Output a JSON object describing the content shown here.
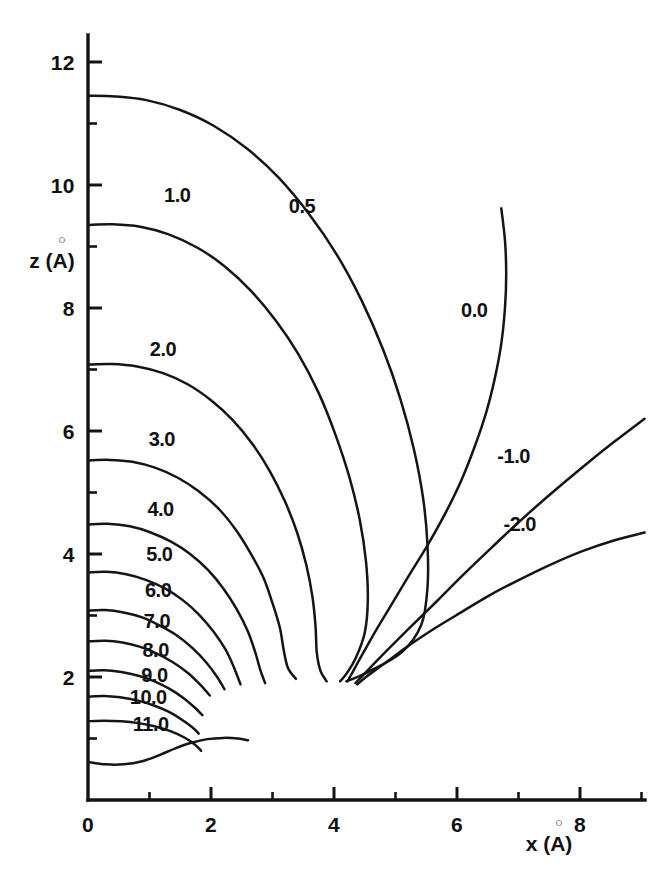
{
  "figure": {
    "kind": "contour-plot",
    "background_color": "#ffffff",
    "line_color": "#151515",
    "width": 652,
    "height": 873
  },
  "axes": {
    "x": {
      "title": "x (A)",
      "title_symbol": "x",
      "title_unit": "(Å)",
      "unit_letter": "A",
      "min": 0,
      "max": 9.15,
      "major_ticks": [
        0,
        2,
        4,
        6,
        8
      ],
      "major_tick_labels": [
        "0",
        "2",
        "4",
        "6",
        "8"
      ],
      "minor_ticks": [
        1,
        3,
        5,
        7,
        9
      ]
    },
    "z": {
      "title": "z (A)",
      "title_symbol": "z",
      "title_unit": "(Å)",
      "unit_letter": "A",
      "min": 0,
      "max": 12.45,
      "major_ticks": [
        2,
        4,
        6,
        8,
        10,
        12
      ],
      "major_tick_labels": [
        "2",
        "4",
        "6",
        "8",
        "10",
        "12"
      ],
      "minor_ticks": [
        1,
        3,
        5,
        7,
        9,
        11
      ]
    }
  },
  "chart_data": {
    "type": "line",
    "subtype": "contour",
    "title": "",
    "xlabel": "x (Å)",
    "ylabel": "z (Å)",
    "xlim": [
      0,
      9.15
    ],
    "ylim": [
      0,
      12.45
    ],
    "grid": false,
    "legend": "none",
    "label_format": "inline contour labels",
    "contour_levels": [
      0.5,
      1.0,
      2.0,
      3.0,
      4.0,
      5.0,
      6.0,
      7.0,
      8.0,
      9.0,
      10.0,
      11.0,
      0.0,
      -1.0,
      -2.0
    ],
    "convergence_point": {
      "x": 4.0,
      "z": 2.0
    },
    "series": [
      {
        "name": "0.5",
        "label": "0.5",
        "label_at": {
          "x": 3.48,
          "z": 9.55
        },
        "z_intercept": 11.45,
        "points": [
          {
            "x": 0.0,
            "z": 11.45
          },
          {
            "x": 0.45,
            "z": 11.44
          },
          {
            "x": 0.95,
            "z": 11.38
          },
          {
            "x": 1.5,
            "z": 11.22
          },
          {
            "x": 2.05,
            "z": 10.96
          },
          {
            "x": 2.6,
            "z": 10.58
          },
          {
            "x": 3.1,
            "z": 10.12
          },
          {
            "x": 3.6,
            "z": 9.52
          },
          {
            "x": 4.05,
            "z": 8.86
          },
          {
            "x": 4.45,
            "z": 8.12
          },
          {
            "x": 4.8,
            "z": 7.32
          },
          {
            "x": 5.08,
            "z": 6.52
          },
          {
            "x": 5.3,
            "z": 5.7
          },
          {
            "x": 5.45,
            "z": 4.9
          },
          {
            "x": 5.52,
            "z": 4.15
          },
          {
            "x": 5.52,
            "z": 3.45
          },
          {
            "x": 5.42,
            "z": 2.85
          },
          {
            "x": 5.1,
            "z": 2.4
          },
          {
            "x": 4.55,
            "z": 2.08
          },
          {
            "x": 4.2,
            "z": 1.93
          }
        ]
      },
      {
        "name": "1.0",
        "label": "1.0",
        "label_at": {
          "x": 1.45,
          "z": 9.72
        },
        "z_intercept": 9.35,
        "points": [
          {
            "x": 0.0,
            "z": 9.35
          },
          {
            "x": 0.4,
            "z": 9.36
          },
          {
            "x": 0.85,
            "z": 9.32
          },
          {
            "x": 1.3,
            "z": 9.2
          },
          {
            "x": 1.78,
            "z": 8.98
          },
          {
            "x": 2.22,
            "z": 8.68
          },
          {
            "x": 2.65,
            "z": 8.28
          },
          {
            "x": 3.05,
            "z": 7.8
          },
          {
            "x": 3.42,
            "z": 7.25
          },
          {
            "x": 3.75,
            "z": 6.62
          },
          {
            "x": 4.02,
            "z": 5.95
          },
          {
            "x": 4.25,
            "z": 5.25
          },
          {
            "x": 4.42,
            "z": 4.55
          },
          {
            "x": 4.52,
            "z": 3.88
          },
          {
            "x": 4.55,
            "z": 3.25
          },
          {
            "x": 4.5,
            "z": 2.72
          },
          {
            "x": 4.35,
            "z": 2.3
          },
          {
            "x": 4.2,
            "z": 2.05
          },
          {
            "x": 4.1,
            "z": 1.93
          }
        ]
      },
      {
        "name": "2.0",
        "label": "2.0",
        "label_at": {
          "x": 1.22,
          "z": 7.22
        },
        "z_intercept": 7.08,
        "points": [
          {
            "x": 0.0,
            "z": 7.08
          },
          {
            "x": 0.38,
            "z": 7.09
          },
          {
            "x": 0.8,
            "z": 7.05
          },
          {
            "x": 1.22,
            "z": 6.94
          },
          {
            "x": 1.62,
            "z": 6.76
          },
          {
            "x": 2.0,
            "z": 6.5
          },
          {
            "x": 2.35,
            "z": 6.18
          },
          {
            "x": 2.68,
            "z": 5.78
          },
          {
            "x": 2.96,
            "z": 5.34
          },
          {
            "x": 3.2,
            "z": 4.86
          },
          {
            "x": 3.4,
            "z": 4.35
          },
          {
            "x": 3.55,
            "z": 3.82
          },
          {
            "x": 3.65,
            "z": 3.3
          },
          {
            "x": 3.7,
            "z": 2.82
          },
          {
            "x": 3.72,
            "z": 2.4
          },
          {
            "x": 3.78,
            "z": 2.1
          },
          {
            "x": 3.88,
            "z": 1.93
          }
        ]
      },
      {
        "name": "3.0",
        "label": "3.0",
        "label_at": {
          "x": 1.2,
          "z": 5.75
        },
        "z_intercept": 5.52,
        "points": [
          {
            "x": 0.0,
            "z": 5.52
          },
          {
            "x": 0.35,
            "z": 5.53
          },
          {
            "x": 0.72,
            "z": 5.5
          },
          {
            "x": 1.1,
            "z": 5.4
          },
          {
            "x": 1.46,
            "z": 5.24
          },
          {
            "x": 1.8,
            "z": 5.02
          },
          {
            "x": 2.12,
            "z": 4.74
          },
          {
            "x": 2.4,
            "z": 4.4
          },
          {
            "x": 2.64,
            "z": 4.02
          },
          {
            "x": 2.85,
            "z": 3.62
          },
          {
            "x": 3.0,
            "z": 3.2
          },
          {
            "x": 3.12,
            "z": 2.8
          },
          {
            "x": 3.18,
            "z": 2.45
          },
          {
            "x": 3.25,
            "z": 2.15
          },
          {
            "x": 3.38,
            "z": 1.97
          }
        ]
      },
      {
        "name": "4.0",
        "label": "4.0",
        "label_at": {
          "x": 1.18,
          "z": 4.62
        },
        "z_intercept": 4.48,
        "points": [
          {
            "x": 0.0,
            "z": 4.48
          },
          {
            "x": 0.32,
            "z": 4.49
          },
          {
            "x": 0.68,
            "z": 4.45
          },
          {
            "x": 1.02,
            "z": 4.35
          },
          {
            "x": 1.35,
            "z": 4.2
          },
          {
            "x": 1.66,
            "z": 4.0
          },
          {
            "x": 1.95,
            "z": 3.74
          },
          {
            "x": 2.2,
            "z": 3.44
          },
          {
            "x": 2.42,
            "z": 3.1
          },
          {
            "x": 2.6,
            "z": 2.74
          },
          {
            "x": 2.72,
            "z": 2.4
          },
          {
            "x": 2.8,
            "z": 2.12
          },
          {
            "x": 2.88,
            "z": 1.9
          }
        ]
      },
      {
        "name": "5.0",
        "label": "5.0",
        "label_at": {
          "x": 1.16,
          "z": 3.88
        },
        "z_intercept": 3.7,
        "points": [
          {
            "x": 0.0,
            "z": 3.7
          },
          {
            "x": 0.3,
            "z": 3.71
          },
          {
            "x": 0.62,
            "z": 3.67
          },
          {
            "x": 0.94,
            "z": 3.58
          },
          {
            "x": 1.25,
            "z": 3.44
          },
          {
            "x": 1.54,
            "z": 3.25
          },
          {
            "x": 1.8,
            "z": 3.02
          },
          {
            "x": 2.04,
            "z": 2.74
          },
          {
            "x": 2.24,
            "z": 2.44
          },
          {
            "x": 2.38,
            "z": 2.14
          },
          {
            "x": 2.48,
            "z": 1.88
          }
        ]
      },
      {
        "name": "6.0",
        "label": "6.0",
        "label_at": {
          "x": 1.14,
          "z": 3.3
        },
        "z_intercept": 3.08,
        "points": [
          {
            "x": 0.0,
            "z": 3.08
          },
          {
            "x": 0.28,
            "z": 3.09
          },
          {
            "x": 0.58,
            "z": 3.05
          },
          {
            "x": 0.88,
            "z": 2.97
          },
          {
            "x": 1.16,
            "z": 2.84
          },
          {
            "x": 1.44,
            "z": 2.68
          },
          {
            "x": 1.7,
            "z": 2.47
          },
          {
            "x": 1.92,
            "z": 2.24
          },
          {
            "x": 2.1,
            "z": 2.0
          },
          {
            "x": 2.22,
            "z": 1.8
          }
        ]
      },
      {
        "name": "7.0",
        "label": "7.0",
        "label_at": {
          "x": 1.12,
          "z": 2.8
        },
        "z_intercept": 2.58,
        "points": [
          {
            "x": 0.0,
            "z": 2.58
          },
          {
            "x": 0.28,
            "z": 2.59
          },
          {
            "x": 0.56,
            "z": 2.56
          },
          {
            "x": 0.85,
            "z": 2.49
          },
          {
            "x": 1.12,
            "z": 2.38
          },
          {
            "x": 1.38,
            "z": 2.24
          },
          {
            "x": 1.62,
            "z": 2.07
          },
          {
            "x": 1.82,
            "z": 1.88
          },
          {
            "x": 1.98,
            "z": 1.7
          }
        ]
      },
      {
        "name": "8.0",
        "label": "8.0",
        "label_at": {
          "x": 1.1,
          "z": 2.32
        },
        "z_intercept": 2.1,
        "points": [
          {
            "x": 0.0,
            "z": 2.1
          },
          {
            "x": 0.26,
            "z": 2.11
          },
          {
            "x": 0.54,
            "z": 2.08
          },
          {
            "x": 0.82,
            "z": 2.02
          },
          {
            "x": 1.08,
            "z": 1.93
          },
          {
            "x": 1.32,
            "z": 1.81
          },
          {
            "x": 1.55,
            "z": 1.66
          },
          {
            "x": 1.74,
            "z": 1.5
          },
          {
            "x": 1.86,
            "z": 1.38
          }
        ]
      },
      {
        "name": "9.0",
        "label": "9.0",
        "label_at": {
          "x": 1.08,
          "z": 1.92
        },
        "z_intercept": 1.68,
        "points": [
          {
            "x": 0.0,
            "z": 1.68
          },
          {
            "x": 0.26,
            "z": 1.69
          },
          {
            "x": 0.52,
            "z": 1.67
          },
          {
            "x": 0.8,
            "z": 1.62
          },
          {
            "x": 1.06,
            "z": 1.54
          },
          {
            "x": 1.3,
            "z": 1.44
          },
          {
            "x": 1.52,
            "z": 1.31
          },
          {
            "x": 1.7,
            "z": 1.18
          },
          {
            "x": 1.8,
            "z": 1.08
          }
        ]
      },
      {
        "name": "10.0",
        "label": "10.0",
        "label_at": {
          "x": 0.98,
          "z": 1.56
        },
        "z_intercept": 1.28,
        "points": [
          {
            "x": 0.0,
            "z": 1.28
          },
          {
            "x": 0.26,
            "z": 1.29
          },
          {
            "x": 0.54,
            "z": 1.28
          },
          {
            "x": 0.82,
            "z": 1.25
          },
          {
            "x": 1.08,
            "z": 1.2
          },
          {
            "x": 1.34,
            "z": 1.12
          },
          {
            "x": 1.56,
            "z": 1.02
          },
          {
            "x": 1.74,
            "z": 0.9
          },
          {
            "x": 1.84,
            "z": 0.8
          }
        ]
      },
      {
        "name": "11.0",
        "label": "11.0",
        "label_at": {
          "x": 1.02,
          "z": 1.12
        },
        "z_intercept": 0.62,
        "points": [
          {
            "x": 0.0,
            "z": 0.62
          },
          {
            "x": 0.28,
            "z": 0.58
          },
          {
            "x": 0.58,
            "z": 0.58
          },
          {
            "x": 0.88,
            "z": 0.63
          },
          {
            "x": 1.16,
            "z": 0.73
          },
          {
            "x": 1.42,
            "z": 0.84
          },
          {
            "x": 1.68,
            "z": 0.93
          },
          {
            "x": 1.94,
            "z": 0.99
          },
          {
            "x": 2.2,
            "z": 1.01
          },
          {
            "x": 2.44,
            "z": 1.0
          },
          {
            "x": 2.6,
            "z": 0.97
          }
        ]
      },
      {
        "name": "0.0",
        "label": "0.0",
        "label_at": {
          "x": 6.28,
          "z": 7.85
        },
        "points": [
          {
            "x": 6.72,
            "z": 9.62
          },
          {
            "x": 6.78,
            "z": 9.1
          },
          {
            "x": 6.8,
            "z": 8.55
          },
          {
            "x": 6.78,
            "z": 8.0
          },
          {
            "x": 6.72,
            "z": 7.42
          },
          {
            "x": 6.62,
            "z": 6.88
          },
          {
            "x": 6.48,
            "z": 6.32
          },
          {
            "x": 6.3,
            "z": 5.78
          },
          {
            "x": 6.08,
            "z": 5.22
          },
          {
            "x": 5.82,
            "z": 4.68
          },
          {
            "x": 5.52,
            "z": 4.14
          },
          {
            "x": 5.2,
            "z": 3.62
          },
          {
            "x": 4.9,
            "z": 3.12
          },
          {
            "x": 4.62,
            "z": 2.65
          },
          {
            "x": 4.38,
            "z": 2.22
          },
          {
            "x": 4.22,
            "z": 1.93
          }
        ]
      },
      {
        "name": "-1.0",
        "label": "-1.0",
        "label_at": {
          "x": 6.92,
          "z": 5.48
        },
        "points": [
          {
            "x": 9.05,
            "z": 6.2
          },
          {
            "x": 8.55,
            "z": 5.82
          },
          {
            "x": 8.05,
            "z": 5.42
          },
          {
            "x": 7.55,
            "z": 5.0
          },
          {
            "x": 7.05,
            "z": 4.56
          },
          {
            "x": 6.58,
            "z": 4.12
          },
          {
            "x": 6.12,
            "z": 3.68
          },
          {
            "x": 5.68,
            "z": 3.24
          },
          {
            "x": 5.25,
            "z": 2.82
          },
          {
            "x": 4.85,
            "z": 2.42
          },
          {
            "x": 4.52,
            "z": 2.08
          },
          {
            "x": 4.35,
            "z": 1.9
          }
        ]
      },
      {
        "name": "-2.0",
        "label": "-2.0",
        "label_at": {
          "x": 7.02,
          "z": 4.38
        },
        "points": [
          {
            "x": 9.05,
            "z": 4.35
          },
          {
            "x": 8.55,
            "z": 4.22
          },
          {
            "x": 8.05,
            "z": 4.05
          },
          {
            "x": 7.55,
            "z": 3.84
          },
          {
            "x": 7.05,
            "z": 3.6
          },
          {
            "x": 6.55,
            "z": 3.34
          },
          {
            "x": 6.08,
            "z": 3.06
          },
          {
            "x": 5.62,
            "z": 2.78
          },
          {
            "x": 5.2,
            "z": 2.5
          },
          {
            "x": 4.82,
            "z": 2.22
          },
          {
            "x": 4.52,
            "z": 2.0
          },
          {
            "x": 4.38,
            "z": 1.88
          }
        ]
      }
    ]
  }
}
